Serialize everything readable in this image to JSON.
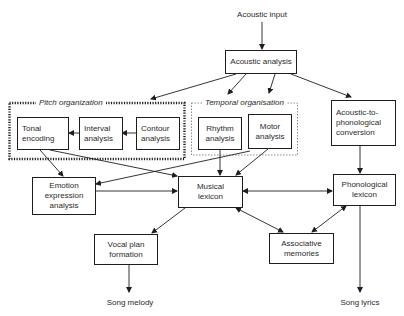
{
  "diagram": {
    "input_label": "Acoustic input",
    "outputs": {
      "song_melody": "Song melody",
      "song_lyrics": "Song lyrics"
    },
    "groups": {
      "pitch": {
        "title": "Pitch organization",
        "border": "dotted-heavy"
      },
      "temporal": {
        "title": "Temporal organisation",
        "border": "dotted-light"
      }
    },
    "nodes": {
      "acoustic_analysis": "Acoustic analysis",
      "tonal_encoding": "Tonal\nencoding",
      "interval_analysis": "Interval\nanalysis",
      "contour_analysis": "Contour\nanalysis",
      "rhythm_analysis": "Rhythm\nanalysis",
      "motor_analysis": "Motor\nanalysis",
      "acoustic_to_phonological": "Acoustic-to-\nphonological\nconversion",
      "emotion_expression": "Emotion\nexpression\nanalysis",
      "musical_lexicon": "Musical\nlexicon",
      "phonological_lexicon": "Phonological\nlexicon",
      "vocal_plan": "Vocal plan\nformation",
      "associative_memories": "Associative\nmemories"
    },
    "edges": [
      {
        "from": "Acoustic input",
        "to": "Acoustic analysis",
        "type": "directed"
      },
      {
        "from": "Acoustic analysis",
        "to": "Pitch organization",
        "type": "directed"
      },
      {
        "from": "Acoustic analysis",
        "to": "Rhythm analysis",
        "type": "directed"
      },
      {
        "from": "Acoustic analysis",
        "to": "Motor analysis",
        "type": "directed"
      },
      {
        "from": "Acoustic analysis",
        "to": "Acoustic-to-phonological conversion",
        "type": "directed"
      },
      {
        "from": "Contour analysis",
        "to": "Interval analysis",
        "type": "directed"
      },
      {
        "from": "Interval analysis",
        "to": "Tonal encoding",
        "type": "directed"
      },
      {
        "from": "Tonal encoding",
        "to": "Emotion expression analysis",
        "type": "directed"
      },
      {
        "from": "Tonal encoding",
        "to": "Musical lexicon",
        "type": "directed"
      },
      {
        "from": "Temporal organisation",
        "to": "Emotion expression analysis",
        "type": "directed"
      },
      {
        "from": "Rhythm analysis",
        "to": "Musical lexicon",
        "type": "directed"
      },
      {
        "from": "Motor analysis",
        "to": "Musical lexicon",
        "type": "directed"
      },
      {
        "from": "Emotion expression analysis",
        "to": "Musical lexicon",
        "type": "directed"
      },
      {
        "from": "Acoustic-to-phonological conversion",
        "to": "Phonological lexicon",
        "type": "directed"
      },
      {
        "from": "Musical lexicon",
        "to": "Phonological lexicon",
        "type": "bidirectional"
      },
      {
        "from": "Musical lexicon",
        "to": "Vocal plan formation",
        "type": "directed"
      },
      {
        "from": "Musical lexicon",
        "to": "Associative memories",
        "type": "bidirectional"
      },
      {
        "from": "Phonological lexicon",
        "to": "Associative memories",
        "type": "bidirectional"
      },
      {
        "from": "Vocal plan formation",
        "to": "Song melody",
        "type": "directed"
      },
      {
        "from": "Phonological lexicon",
        "to": "Song lyrics",
        "type": "directed"
      }
    ],
    "colors": {
      "line": "#1e1e1e",
      "text": "#2a2a2a",
      "background": "#ffffff"
    }
  }
}
